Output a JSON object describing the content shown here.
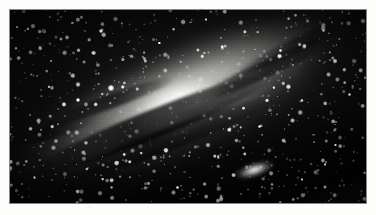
{
  "page": {
    "background_color": "#fdfdfc",
    "width": 376,
    "height": 215
  },
  "photograph": {
    "name": "andromeda-galaxy-plate",
    "subject": "Andromeda Galaxy (M31) spiral galaxy photographic plate",
    "alt_text": "Black and white astronomical photograph of a large tilted spiral galaxy with a bright elongated nucleus, dark dust lanes, a dense surrounding star field and a small companion galaxy below right of centre",
    "color_mode": "grayscale",
    "frame": {
      "x": 10,
      "y": 10,
      "width": 356,
      "height": 193
    },
    "sky_color": "#080808",
    "core_color": "#ffffff",
    "dust_lane_color": "#060606"
  },
  "features": {
    "galaxy_core": {
      "label": "galactic-nucleus",
      "center_pct": {
        "x": 49.5,
        "y": 47.5
      },
      "brightness": "peak-white"
    },
    "galaxy_disc": {
      "label": "galaxy-disc",
      "inclination_deg": -24,
      "extent_pct": {
        "width": 104,
        "height": 56
      }
    },
    "dust_lanes_count": 6,
    "satellite_galaxy": {
      "label": "companion-galaxy",
      "center_pct": {
        "x": 68.5,
        "y": 83.2
      }
    },
    "bright_stars": [
      {
        "name": "bright-star-upper-left",
        "x_pct": 25.6,
        "y_pct": 11.0,
        "size": 4.4
      },
      {
        "name": "bright-star-left-disc",
        "x_pct": 28.4,
        "y_pct": 40.5,
        "size": 5.6
      },
      {
        "name": "bright-star-left-lower",
        "x_pct": 19.2,
        "y_pct": 46.5,
        "size": 3.8
      },
      {
        "name": "bright-star-upper-right",
        "x_pct": 88.0,
        "y_pct": 10.5,
        "size": 3.4
      },
      {
        "name": "bright-star-right-mid",
        "x_pct": 70.0,
        "y_pct": 60.5,
        "size": 3.4
      },
      {
        "name": "bright-star-far-right",
        "x_pct": 95.5,
        "y_pct": 44.0,
        "size": 3.0
      },
      {
        "name": "bright-star-lower-left",
        "x_pct": 7.0,
        "y_pct": 87.0,
        "size": 3.0
      },
      {
        "name": "bright-star-lower-mid",
        "x_pct": 47.0,
        "y_pct": 92.0,
        "size": 2.6
      },
      {
        "name": "bright-star-top-mid",
        "x_pct": 55.0,
        "y_pct": 5.0,
        "size": 2.6
      },
      {
        "name": "bright-star-right-low",
        "x_pct": 82.0,
        "y_pct": 88.0,
        "size": 2.8
      },
      {
        "name": "bright-star-mid-right",
        "x_pct": 91.5,
        "y_pct": 70.0,
        "size": 2.6
      },
      {
        "name": "bright-star-upper-mid",
        "x_pct": 42.0,
        "y_pct": 17.0,
        "size": 2.4
      },
      {
        "name": "bright-star-left-top",
        "x_pct": 11.5,
        "y_pct": 26.5,
        "size": 2.4
      },
      {
        "name": "bright-star-right-top",
        "x_pct": 76.0,
        "y_pct": 21.0,
        "size": 2.2
      },
      {
        "name": "bright-star-bottom-right",
        "x_pct": 88.5,
        "y_pct": 80.0,
        "size": 2.4
      }
    ]
  },
  "caption": {
    "text": ""
  }
}
